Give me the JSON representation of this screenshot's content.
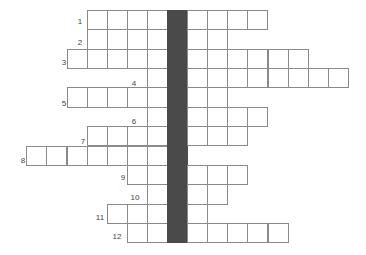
{
  "puzzle": {
    "type": "crossword",
    "key_column_color": "#4a4a4a",
    "cell_border_color": "#8a8a8a",
    "key_column_index": 0,
    "rows": [
      {
        "label": "1",
        "start": -4,
        "end": 5,
        "label_x": 80,
        "label_y": 22
      },
      {
        "label": "2",
        "start": -4,
        "end": 3,
        "label_x": 80,
        "label_y": 43
      },
      {
        "label": "3",
        "start": -5,
        "end": 7,
        "label_x": 64,
        "label_y": 63
      },
      {
        "label": "4",
        "start": -1,
        "end": 9,
        "label_x": 134,
        "label_y": 84
      },
      {
        "label": "5",
        "start": -5,
        "end": 3,
        "label_x": 64,
        "label_y": 104
      },
      {
        "label": "6",
        "start": -1,
        "end": 5,
        "label_x": 134,
        "label_y": 122
      },
      {
        "label": "7",
        "start": -4,
        "end": 4,
        "label_x": 83,
        "label_y": 142
      },
      {
        "label": "8",
        "start": -7,
        "end": 1,
        "label_x": 23,
        "label_y": 161
      },
      {
        "label": "9",
        "start": -2,
        "end": 4,
        "label_x": 123,
        "label_y": 178
      },
      {
        "label": "10",
        "start": -1,
        "end": 3,
        "label_x": 135,
        "label_y": 198
      },
      {
        "label": "11",
        "start": -3,
        "end": 2,
        "label_x": 100,
        "label_y": 218
      },
      {
        "label": "12",
        "start": -2,
        "end": 6,
        "label_x": 117,
        "label_y": 237
      }
    ]
  }
}
